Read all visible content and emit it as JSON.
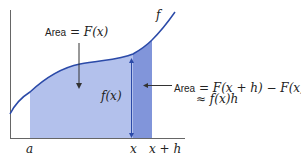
{
  "diagram": {
    "title_label": {
      "prefix": "Area",
      "eq": " = ",
      "expr": "F(x)"
    },
    "curve_label": "f",
    "height_label": "f(x)",
    "strip_label": {
      "prefix": "Area",
      "line1": " = F(x + h) − F(x)",
      "line2": "≈ f(x)h"
    },
    "x_ticks": {
      "a": "a",
      "x": "x",
      "xh": "x + h"
    },
    "colors": {
      "curve": "#2b4aa8",
      "fill_light": "#b3c1ec",
      "fill_dark": "#7f94d9",
      "axis": "#555555",
      "arrow": "#2b4aa8"
    }
  }
}
